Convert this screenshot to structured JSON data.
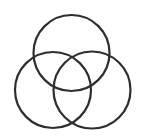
{
  "diagram": {
    "type": "venn-three-circles",
    "background": "#ffffff",
    "stroke_color": "#2e2e2e",
    "stroke_width": 2.2,
    "circles": [
      {
        "name": "top-circle",
        "cx": 71.5,
        "cy": 53,
        "r": 38
      },
      {
        "name": "left-circle",
        "cx": 53,
        "cy": 90,
        "r": 38
      },
      {
        "name": "right-circle",
        "cx": 92,
        "cy": 90,
        "r": 38.5
      }
    ]
  }
}
